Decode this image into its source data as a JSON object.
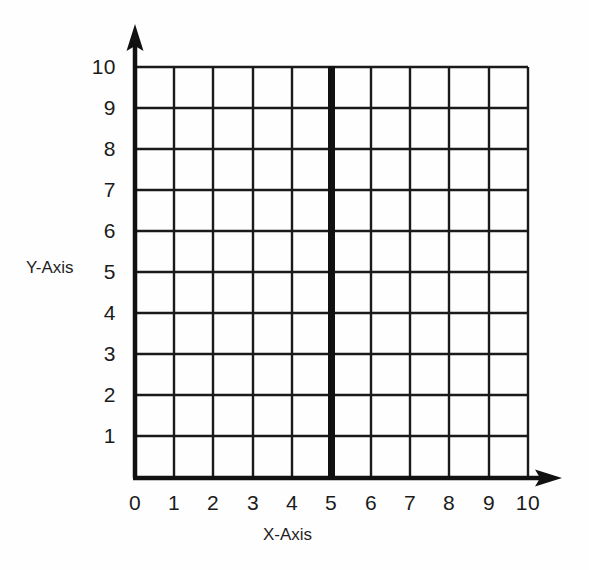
{
  "chart_data": {
    "type": "line",
    "title": "",
    "subtitle": "",
    "xlabel": "X-Axis",
    "ylabel": "Y-Axis",
    "xlim": [
      0,
      10
    ],
    "ylim": [
      0,
      10
    ],
    "grid": true,
    "grid_spacing": 1,
    "legend": "none",
    "x_ticks": [
      "0",
      "1",
      "2",
      "3",
      "4",
      "5",
      "6",
      "7",
      "8",
      "9",
      "10"
    ],
    "y_ticks": [
      "1",
      "2",
      "3",
      "4",
      "5",
      "6",
      "7",
      "8",
      "9",
      "10"
    ],
    "x_tick_values": [
      0,
      1,
      2,
      3,
      4,
      5,
      6,
      7,
      8,
      9,
      10
    ],
    "y_tick_values": [
      1,
      2,
      3,
      4,
      5,
      6,
      7,
      8,
      9,
      10
    ],
    "axis_arrows": true,
    "series": [
      {
        "name": "vertical line x = 5",
        "type": "vertical-line",
        "x": 5,
        "y_start": 0,
        "y_end": 10,
        "color": "#111111",
        "linewidth_px": 7,
        "points": [
          [
            5,
            0
          ],
          [
            5,
            10
          ]
        ]
      }
    ],
    "annotations": []
  },
  "style": {
    "background": "#fefefe",
    "grid_color": "#1a1a1a",
    "axis_color": "#111111",
    "tick_label_color": "#1b1b1b",
    "highlight_color": "#111111"
  },
  "axes": {
    "x_title": "X-Axis",
    "y_title": "Y-Axis"
  }
}
